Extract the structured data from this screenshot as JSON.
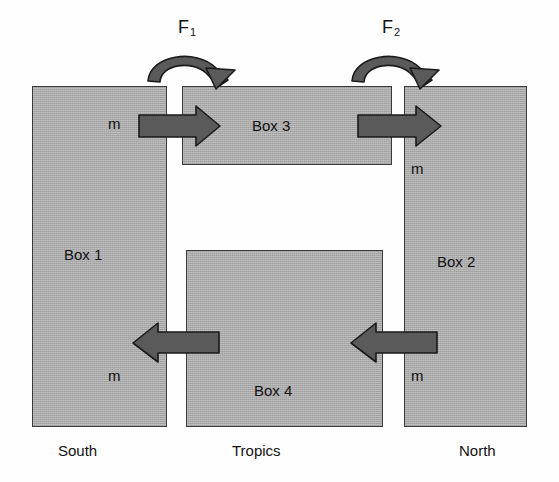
{
  "figure": {
    "type": "box-model-diagram",
    "colors": {
      "box_fill": "#ababab",
      "box_border": "#3a3a3a",
      "arrow_fill": "#5a5a5a",
      "arrow_stroke": "#1a1a1a",
      "text": "#111111",
      "background": "#ffffff"
    }
  },
  "boxes": [
    {
      "id": "box1",
      "label": "Box 1",
      "region": "South"
    },
    {
      "id": "box2",
      "label": "Box 2",
      "region": "North"
    },
    {
      "id": "box3",
      "label": "Box 3",
      "region": "Tropics"
    },
    {
      "id": "box4",
      "label": "Box 4",
      "region": "Tropics"
    }
  ],
  "region_labels": {
    "south": "South",
    "tropics": "Tropics",
    "north": "North"
  },
  "flux_labels": {
    "f1": {
      "symbol": "F",
      "subscript": "1"
    },
    "f2": {
      "symbol": "F",
      "subscript": "2"
    }
  },
  "mass_labels": {
    "upper_left": "m",
    "upper_right": "m",
    "lower_left": "m",
    "lower_right": "m"
  },
  "arrows": [
    {
      "id": "upper-left",
      "direction": "right",
      "label": "m",
      "from": "box1",
      "to": "box3"
    },
    {
      "id": "upper-right",
      "direction": "right",
      "label": "m",
      "from": "box3",
      "to": "box2"
    },
    {
      "id": "lower-left",
      "direction": "left",
      "label": "m",
      "from": "box4",
      "to": "box1"
    },
    {
      "id": "lower-right",
      "direction": "left",
      "label": "m",
      "from": "box2",
      "to": "box4"
    },
    {
      "id": "curved-f1",
      "direction": "clockwise-over-top",
      "label": "F1"
    },
    {
      "id": "curved-f2",
      "direction": "clockwise-over-top",
      "label": "F2"
    }
  ]
}
